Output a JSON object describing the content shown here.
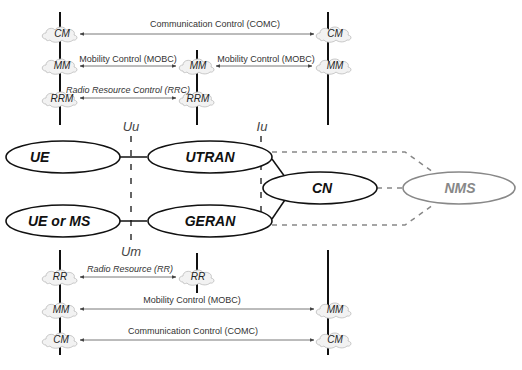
{
  "diagram": {
    "top_section": {
      "stacks": {
        "left": [
          "CM",
          "MM",
          "RRM"
        ],
        "middle": [
          "MM",
          "RRM"
        ],
        "right": [
          "CM",
          "MM"
        ]
      },
      "arrows": [
        {
          "label": "Communication Control (COMC)",
          "from": "left.CM",
          "to": "right.CM",
          "italic": false
        },
        {
          "label": "Mobility Control (MOBC)",
          "from": "left.MM",
          "to": "middle.MM",
          "italic": false
        },
        {
          "label": "Mobility Control (MOBC)",
          "from": "middle.MM",
          "to": "right.MM",
          "italic": false
        },
        {
          "label": "Radio Resource Control (RRC)",
          "from": "left.RRM",
          "to": "middle.RRM",
          "italic": true
        }
      ]
    },
    "interfaces": {
      "uu": "Uu",
      "um": "Um",
      "iu": "Iu"
    },
    "nodes": {
      "ue": "UE",
      "ue_or_ms": "UE or MS",
      "utran": "UTRAN",
      "geran": "GERAN",
      "cn": "CN",
      "nms": "NMS"
    },
    "bottom_section": {
      "stacks": {
        "left": [
          "RR",
          "MM",
          "CM"
        ],
        "middle": [
          "RR"
        ],
        "right": [
          "MM",
          "CM"
        ]
      },
      "arrows": [
        {
          "label": "Radio Resource  (RR)",
          "from": "left.RR",
          "to": "middle.RR",
          "italic": true
        },
        {
          "label": "Mobility Control (MOBC)",
          "from": "left.MM",
          "to": "right.MM",
          "italic": false
        },
        {
          "label": "Communication Control (COMC)",
          "from": "left.CM",
          "to": "right.CM",
          "italic": false
        }
      ]
    },
    "colors": {
      "line": "#111111",
      "arrow": "#555555",
      "dashed": "#888888",
      "nms_outline": "#888888",
      "cloud_fill": "#f2f2f2",
      "cloud_stroke": "#bbbbbb"
    }
  }
}
